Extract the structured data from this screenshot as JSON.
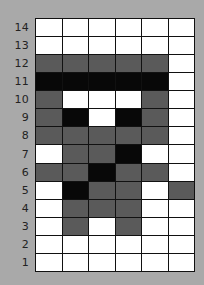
{
  "colors": {
    "background": "#a9a9a9",
    "white": "#ffffff",
    "grey": "#5a5a5a",
    "black": "#080808",
    "gridline": "#111111"
  },
  "grid": {
    "columns": 6,
    "row_labels": [
      "14",
      "13",
      "12",
      "11",
      "10",
      "9",
      "8",
      "7",
      "6",
      "5",
      "4",
      "3",
      "2",
      "1"
    ],
    "rows": [
      {
        "label": "14",
        "cells": [
          "W",
          "W",
          "W",
          "W",
          "W",
          "W"
        ]
      },
      {
        "label": "13",
        "cells": [
          "W",
          "W",
          "W",
          "W",
          "W",
          "W"
        ]
      },
      {
        "label": "12",
        "cells": [
          "G",
          "G",
          "G",
          "G",
          "G",
          "W"
        ]
      },
      {
        "label": "11",
        "cells": [
          "B",
          "B",
          "B",
          "B",
          "B",
          "W"
        ]
      },
      {
        "label": "10",
        "cells": [
          "G",
          "W",
          "W",
          "W",
          "G",
          "W"
        ]
      },
      {
        "label": "9",
        "cells": [
          "G",
          "B",
          "W",
          "B",
          "G",
          "W"
        ]
      },
      {
        "label": "8",
        "cells": [
          "G",
          "G",
          "G",
          "G",
          "G",
          "W"
        ]
      },
      {
        "label": "7",
        "cells": [
          "W",
          "G",
          "G",
          "B",
          "W",
          "W"
        ]
      },
      {
        "label": "6",
        "cells": [
          "G",
          "G",
          "B",
          "G",
          "G",
          "W"
        ]
      },
      {
        "label": "5",
        "cells": [
          "W",
          "B",
          "G",
          "G",
          "W",
          "G"
        ]
      },
      {
        "label": "4",
        "cells": [
          "W",
          "G",
          "G",
          "G",
          "W",
          "W"
        ]
      },
      {
        "label": "3",
        "cells": [
          "W",
          "G",
          "W",
          "G",
          "W",
          "W"
        ]
      },
      {
        "label": "2",
        "cells": [
          "W",
          "W",
          "W",
          "W",
          "W",
          "W"
        ]
      },
      {
        "label": "1",
        "cells": [
          "W",
          "W",
          "W",
          "W",
          "W",
          "W"
        ]
      }
    ]
  }
}
